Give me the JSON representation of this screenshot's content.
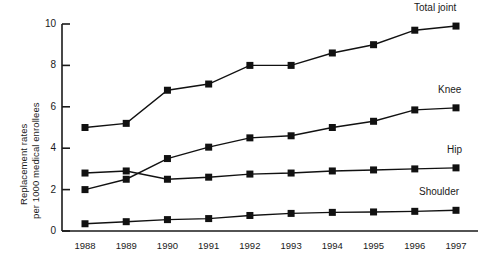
{
  "chart_data": {
    "type": "line",
    "title": "",
    "subtitle": "",
    "xlabel": "",
    "ylabel": "Replacement rates per 1000 medical enrollees",
    "ylabel_lines": [
      "Replacement rates",
      "per 1000 medical enrollees"
    ],
    "categories": [
      "1988",
      "1989",
      "1990",
      "1991",
      "1992",
      "1993",
      "1994",
      "1995",
      "1996",
      "1997"
    ],
    "x": [
      1988,
      1989,
      1990,
      1991,
      1992,
      1993,
      1994,
      1995,
      1996,
      1997
    ],
    "xlim": [
      1987.6,
      1997.4
    ],
    "ylim": [
      0,
      10
    ],
    "yticks": [
      0,
      2,
      4,
      6,
      8,
      10
    ],
    "ytick_labels": [
      "0",
      "2",
      "4",
      "6",
      "8",
      "10"
    ],
    "grid": false,
    "legend": "inline-right-labels",
    "marker": "filled-square",
    "series": [
      {
        "name": "Total joint",
        "label": "Total joint",
        "color": "#111111",
        "values": [
          5.0,
          5.2,
          6.8,
          7.1,
          8.0,
          8.0,
          8.6,
          9.0,
          9.7,
          9.9
        ]
      },
      {
        "name": "Knee",
        "label": "Knee",
        "color": "#111111",
        "values": [
          2.0,
          2.5,
          3.5,
          4.05,
          4.5,
          4.6,
          5.0,
          5.3,
          5.85,
          5.95
        ]
      },
      {
        "name": "Hip",
        "label": "Hip",
        "color": "#111111",
        "values": [
          2.8,
          2.9,
          2.5,
          2.6,
          2.75,
          2.8,
          2.9,
          2.95,
          3.0,
          3.05
        ]
      },
      {
        "name": "Shoulder",
        "label": "Shoulder",
        "color": "#111111",
        "values": [
          0.35,
          0.45,
          0.55,
          0.6,
          0.75,
          0.85,
          0.9,
          0.92,
          0.95,
          1.0
        ]
      }
    ]
  },
  "style": {
    "axis_color": "#1a1a1a",
    "line_color": "#111111",
    "marker_color": "#111111",
    "background": "#ffffff"
  }
}
